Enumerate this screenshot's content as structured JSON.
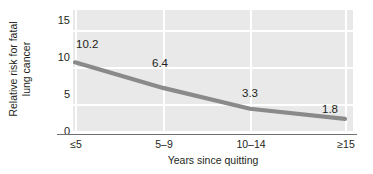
{
  "chart_data": {
    "type": "line",
    "title": "",
    "xlabel": "Years since quitting",
    "ylabel": "Relative risk for fatal lung cancer",
    "ylabel_line1": "Relative risk for fatal",
    "ylabel_line2": "lung cancer",
    "categories": [
      "≤5",
      "5–9",
      "10–14",
      "≥15"
    ],
    "values": [
      10.2,
      6.4,
      3.3,
      1.8
    ],
    "point_labels": [
      "10.2",
      "6.4",
      "3.3",
      "1.8"
    ],
    "yticks": [
      0,
      5,
      10,
      15
    ],
    "ytick_labels": [
      "0",
      "5",
      "10",
      "15"
    ],
    "ylim": [
      0,
      16.5
    ],
    "xlim": [
      0,
      3
    ],
    "grid": true,
    "grid_color": "#ffffff",
    "plot_background": "#e9e9e9",
    "series_color": "#8a8a8a",
    "axis_color": "#6f6f6f",
    "text_color": "#231f20",
    "legend": null,
    "legend_position": "none",
    "series": [
      {
        "name": "Relative risk for fatal lung cancer",
        "values": [
          10.2,
          6.4,
          3.3,
          1.8
        ]
      }
    ]
  }
}
